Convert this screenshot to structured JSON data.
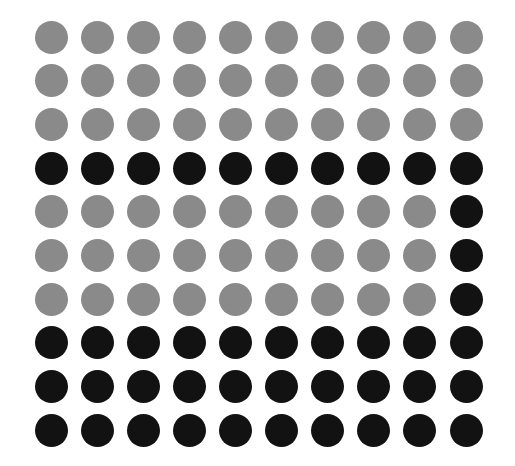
{
  "chart_data": {
    "type": "waffle",
    "rows": 10,
    "cols": 10,
    "colors": {
      "gray": "#8a8a8a",
      "black": "#121212"
    },
    "grid": [
      [
        "gray",
        "gray",
        "gray",
        "gray",
        "gray",
        "gray",
        "gray",
        "gray",
        "gray",
        "gray"
      ],
      [
        "gray",
        "gray",
        "gray",
        "gray",
        "gray",
        "gray",
        "gray",
        "gray",
        "gray",
        "gray"
      ],
      [
        "gray",
        "gray",
        "gray",
        "gray",
        "gray",
        "gray",
        "gray",
        "gray",
        "gray",
        "gray"
      ],
      [
        "black",
        "black",
        "black",
        "black",
        "black",
        "black",
        "black",
        "black",
        "black",
        "black"
      ],
      [
        "gray",
        "gray",
        "gray",
        "gray",
        "gray",
        "gray",
        "gray",
        "gray",
        "gray",
        "black"
      ],
      [
        "gray",
        "gray",
        "gray",
        "gray",
        "gray",
        "gray",
        "gray",
        "gray",
        "gray",
        "black"
      ],
      [
        "gray",
        "gray",
        "gray",
        "gray",
        "gray",
        "gray",
        "gray",
        "gray",
        "gray",
        "black"
      ],
      [
        "black",
        "black",
        "black",
        "black",
        "black",
        "black",
        "black",
        "black",
        "black",
        "black"
      ],
      [
        "black",
        "black",
        "black",
        "black",
        "black",
        "black",
        "black",
        "black",
        "black",
        "black"
      ],
      [
        "black",
        "black",
        "black",
        "black",
        "black",
        "black",
        "black",
        "black",
        "black",
        "black"
      ]
    ],
    "counts": {
      "gray": 57,
      "black": 43
    },
    "title": "",
    "legend": []
  }
}
